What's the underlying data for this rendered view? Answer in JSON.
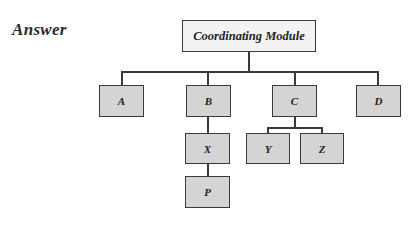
{
  "heading": "Answer",
  "diagram": {
    "type": "hierarchy",
    "root": {
      "id": "root",
      "label": "Coordinating Module"
    },
    "nodes": [
      {
        "id": "A",
        "label": "A",
        "parent": "root"
      },
      {
        "id": "B",
        "label": "B",
        "parent": "root"
      },
      {
        "id": "C",
        "label": "C",
        "parent": "root"
      },
      {
        "id": "D",
        "label": "D",
        "parent": "root"
      },
      {
        "id": "X",
        "label": "X",
        "parent": "B"
      },
      {
        "id": "P",
        "label": "P",
        "parent": "X"
      },
      {
        "id": "Y",
        "label": "Y",
        "parent": "C"
      },
      {
        "id": "Z",
        "label": "Z",
        "parent": "C"
      }
    ]
  },
  "colors": {
    "box_fill": "#d4d4d4",
    "root_fill": "#f3f3f3",
    "line": "#3a3a3a"
  }
}
